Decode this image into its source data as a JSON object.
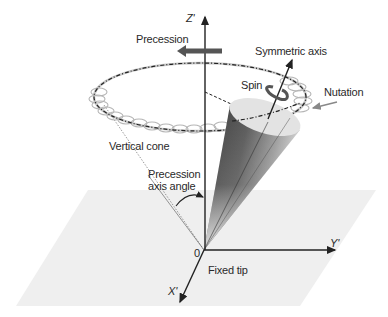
{
  "diagram": {
    "labels": {
      "z_axis": "Z'",
      "y_axis": "Y'",
      "x_axis": "X'",
      "origin": "0",
      "precession": "Precession",
      "symmetric_axis": "Symmetric axis",
      "spin": "Spin",
      "nutation": "Nutation",
      "vertical_cone": "Vertical cone",
      "precession_axis_angle_line1": "Precession",
      "precession_axis_angle_line2": "axis angle",
      "fixed_tip": "Fixed tip"
    },
    "colors": {
      "background": "#ffffff",
      "plane": "#efefef",
      "axis": "#222222",
      "ring": "#b8b8b8",
      "dashed_path": "#222222",
      "arrow_gray": "#666666",
      "cone_dark": "#2b2b2b",
      "cone_light": "#e6e6e6"
    }
  }
}
